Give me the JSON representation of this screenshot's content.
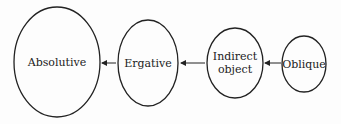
{
  "diagram": {
    "type": "hierarchy",
    "nodes": [
      {
        "id": "absolutive",
        "label": "Absolutive",
        "lines": [
          "Absolutive"
        ]
      },
      {
        "id": "ergative",
        "label": "Ergative",
        "lines": [
          "Ergative"
        ]
      },
      {
        "id": "indirect-object",
        "label": "Indirect object",
        "lines": [
          "Indirect",
          "object"
        ]
      },
      {
        "id": "oblique",
        "label": "Oblique",
        "lines": [
          "Oblique"
        ]
      }
    ],
    "edges": [
      {
        "from": "ergative",
        "to": "absolutive"
      },
      {
        "from": "indirect-object",
        "to": "ergative"
      },
      {
        "from": "oblique",
        "to": "indirect-object"
      }
    ],
    "colors": {
      "stroke": "#222222",
      "background": "#fdfdfd"
    }
  }
}
